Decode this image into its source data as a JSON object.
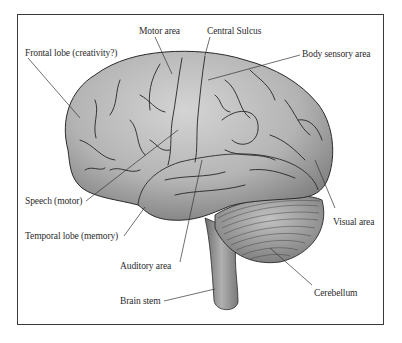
{
  "figure": {
    "type": "anatomical-diagram",
    "colors": {
      "frame": "#3a3a3a",
      "brain_fill": "#b9b9b9",
      "brain_shadow": "#8c8c8c",
      "sulci": "#2a2a2a",
      "cerebellum": "#a8a8a8",
      "leader_line": "#333333",
      "label_text": "#2b2b2b"
    }
  },
  "labels": [
    {
      "id": "motor-area",
      "text": "Motor area",
      "x": 139,
      "y": 26,
      "line": [
        [
          155,
          37
        ],
        [
          172,
          74
        ]
      ]
    },
    {
      "id": "central-sulcus",
      "text": "Central Sulcus",
      "x": 207,
      "y": 26,
      "line": [
        [
          210,
          37
        ],
        [
          205,
          55
        ]
      ]
    },
    {
      "id": "frontal-lobe",
      "text": "Frontal lobe (creativity?)",
      "x": 25,
      "y": 48,
      "line": [
        [
          28,
          58
        ],
        [
          80,
          118
        ]
      ]
    },
    {
      "id": "body-sensory-area",
      "text": "Body sensory area",
      "x": 302,
      "y": 49,
      "line": [
        [
          300,
          55
        ],
        [
          208,
          80
        ]
      ]
    },
    {
      "id": "speech-motor",
      "text": "Speech (motor)",
      "x": 25,
      "y": 196,
      "line": [
        [
          86,
          201
        ],
        [
          178,
          130
        ]
      ]
    },
    {
      "id": "temporal-lobe",
      "text": "Temporal lobe (memory)",
      "x": 25,
      "y": 231,
      "line": [
        [
          124,
          236
        ],
        [
          145,
          207
        ]
      ]
    },
    {
      "id": "visual-area",
      "text": "Visual area",
      "x": 333,
      "y": 217,
      "line": [
        [
          335,
          208
        ],
        [
          315,
          160
        ]
      ]
    },
    {
      "id": "auditory-area",
      "text": "Auditory area",
      "x": 120,
      "y": 261,
      "line": [
        [
          180,
          262
        ],
        [
          202,
          160
        ]
      ]
    },
    {
      "id": "cerebellum",
      "text": "Cerebellum",
      "x": 314,
      "y": 288,
      "line": [
        [
          312,
          285
        ],
        [
          270,
          248
        ]
      ]
    },
    {
      "id": "brain-stem",
      "text": "Brain stem",
      "x": 120,
      "y": 296,
      "line": [
        [
          164,
          301
        ],
        [
          215,
          289
        ]
      ]
    }
  ]
}
